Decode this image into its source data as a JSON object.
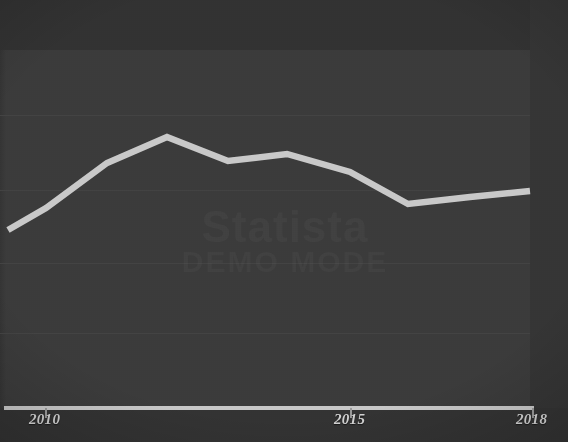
{
  "chart_data": {
    "type": "line",
    "title": "",
    "subtitle": "",
    "xlabel": "",
    "ylabel": "",
    "grid": true,
    "legend": false,
    "legend_position": "none",
    "xlim": [
      2009.4,
      2018.0
    ],
    "ylim": [
      0,
      100
    ],
    "x": [
      2009.4,
      2010,
      2011,
      2012,
      2013,
      2014,
      2015,
      2016,
      2017,
      2018
    ],
    "x_tick_labels": [
      "2010",
      "2015",
      "2018"
    ],
    "x_ticks": [
      2010,
      2015,
      2018
    ],
    "y_gridlines": [
      82,
      59,
      38,
      17
    ],
    "series": [
      {
        "name": "series-1",
        "color": "#c9c9c9",
        "values": [
          46,
          52,
          66,
          73,
          66,
          68,
          63,
          54,
          56,
          58
        ],
        "points": [
          {
            "x": 2009.4,
            "y": 46,
            "px": 8,
            "py": 230
          },
          {
            "x": 2010,
            "y": 52,
            "px": 46,
            "py": 208
          },
          {
            "x": 2011,
            "y": 66,
            "px": 107,
            "py": 163
          },
          {
            "x": 2012,
            "y": 73,
            "px": 167,
            "py": 137
          },
          {
            "x": 2013,
            "y": 66,
            "px": 228,
            "py": 161
          },
          {
            "x": 2014,
            "y": 68,
            "px": 287,
            "py": 154
          },
          {
            "x": 2015,
            "y": 63,
            "px": 350,
            "py": 172
          },
          {
            "x": 2016,
            "y": 54,
            "px": 408,
            "py": 204
          },
          {
            "x": 2017,
            "y": 56,
            "px": 470,
            "py": 197
          },
          {
            "x": 2018,
            "y": 58,
            "px": 530,
            "py": 191
          }
        ]
      }
    ]
  },
  "axis": {
    "x_tick_2010": "2010",
    "x_tick_2015": "2015",
    "x_tick_2018": "2018"
  },
  "watermark": {
    "line1": "Statista",
    "line2": "DEMO MODE"
  },
  "colors": {
    "line": "#c9c9c9",
    "plot_background": "#3b3b3b",
    "outer_background": "#333333",
    "gridline": "#434343",
    "axis": "#c8c8c8",
    "tick_label": "#d2d2d2"
  }
}
